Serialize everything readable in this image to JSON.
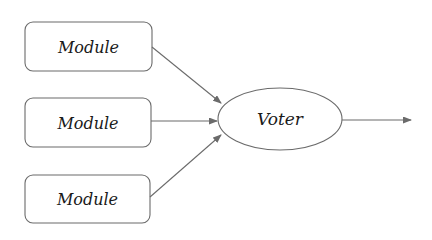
{
  "diagram": {
    "type": "flow",
    "colors": {
      "stroke": "#6b6b6b",
      "text": "#1a1a1a",
      "background": "#ffffff"
    },
    "modules": [
      {
        "id": "module-1",
        "label": "Module"
      },
      {
        "id": "module-2",
        "label": "Module"
      },
      {
        "id": "module-3",
        "label": "Module"
      }
    ],
    "voter": {
      "id": "voter",
      "label": "Voter"
    },
    "edges": [
      {
        "from": "module-1",
        "to": "voter"
      },
      {
        "from": "module-2",
        "to": "voter"
      },
      {
        "from": "module-3",
        "to": "voter"
      },
      {
        "from": "voter",
        "to": "output"
      }
    ]
  }
}
